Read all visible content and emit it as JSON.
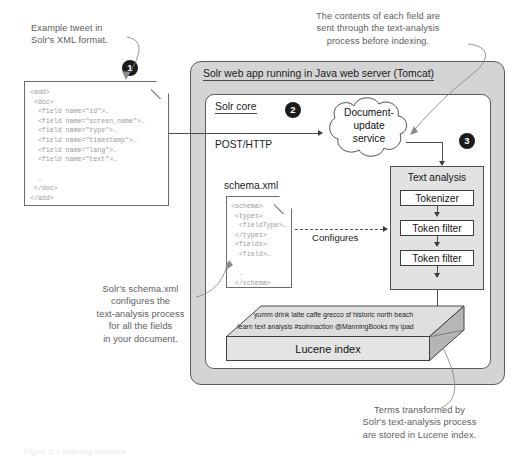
{
  "annotations": {
    "tweet_example": "Example tweet in\nSolr's XML format.",
    "field_contents": "The contents of each field are\nsent through the text-analysis\nprocess before indexing.",
    "schema_note": "Solr's schema.xml\nconfigures the\ntext-analysis process\nfor all the fields\nin your document.",
    "terms_note": "Terms transformed by\nSolr's text-analysis process\nare stored in Lucene index."
  },
  "badges": {
    "one": "1",
    "two": "2",
    "three": "3"
  },
  "tweet_doc": {
    "code": "<add>\n <doc>\n  <field name=\"id\">…\n  <field name=\"screen_name\">…\n  <field name=\"type\">…\n  <field name=\"timestamp\">…\n  <field name=\"lang\">…\n  <field name=\"text\">…\n\n  …\n </doc>\n</add>"
  },
  "outer": {
    "title": "Solr web app running in Java web server (Tomcat)"
  },
  "core": {
    "title": "Solr core",
    "protocol_label": "POST/HTTP",
    "cloud_label": "Document-\nupdate\nservice",
    "cloud_lines": [
      "Document-",
      "update",
      "service"
    ]
  },
  "schema": {
    "title": "schema.xml",
    "configures_label": "Configures",
    "code": "<schema>\n <types>\n  <fieldType>…\n </types>\n <fields>\n  <field>…\n\n  …\n </schema>"
  },
  "text_analysis": {
    "title": "Text analysis",
    "steps": [
      {
        "label": "Tokenizer"
      },
      {
        "label": "Token filter"
      },
      {
        "label": "Token filter"
      }
    ]
  },
  "lucene": {
    "label": "Lucene index",
    "terms_line1": "yumm drink latte caffe grecco sf historic north beach",
    "terms_line2": "learn text analysis #solrinaction @ManningBooks my ipad"
  },
  "figure_caption": "Figure 5.1  Indexing overview",
  "colors": {
    "outer_fill": "#d4d4d4",
    "panel_fill": "#e2e2e2",
    "badge_fill": "#1b1b1b",
    "line": "#4d4d4d",
    "callout_text": "#5d5d5d"
  }
}
